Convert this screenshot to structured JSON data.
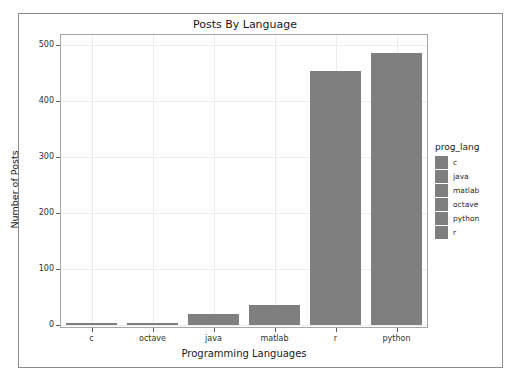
{
  "figure": {
    "background_color": "#ffffff",
    "frame_color": "#8c8c8c",
    "panel_border_color": "#a6a6a6",
    "grid_color": "#ececec",
    "bar_color": "#7f7f7f"
  },
  "chart_data": {
    "type": "bar",
    "title": "Posts By Language",
    "xlabel": "Programming Languages",
    "ylabel": "Number of Posts",
    "categories": [
      "c",
      "octave",
      "java",
      "matlab",
      "r",
      "python"
    ],
    "values": [
      2,
      4,
      19,
      35,
      454,
      486
    ],
    "ylim": [
      0,
      515
    ],
    "yticks": [
      0,
      100,
      200,
      300,
      400,
      500
    ],
    "ytick_labels": [
      "0",
      "100",
      "200",
      "300",
      "400",
      "500"
    ],
    "grid": true,
    "legend_position": "right",
    "legend_title": "prog_lang",
    "legend_entries": [
      {
        "label": "c",
        "color": "#7f7f7f"
      },
      {
        "label": "java",
        "color": "#7f7f7f"
      },
      {
        "label": "matlab",
        "color": "#7f7f7f"
      },
      {
        "label": "octave",
        "color": "#7f7f7f"
      },
      {
        "label": "python",
        "color": "#7f7f7f"
      },
      {
        "label": "r",
        "color": "#7f7f7f"
      }
    ],
    "series": [
      {
        "name": "prog_lang",
        "values": [
          2,
          4,
          19,
          35,
          454,
          486
        ]
      }
    ]
  }
}
